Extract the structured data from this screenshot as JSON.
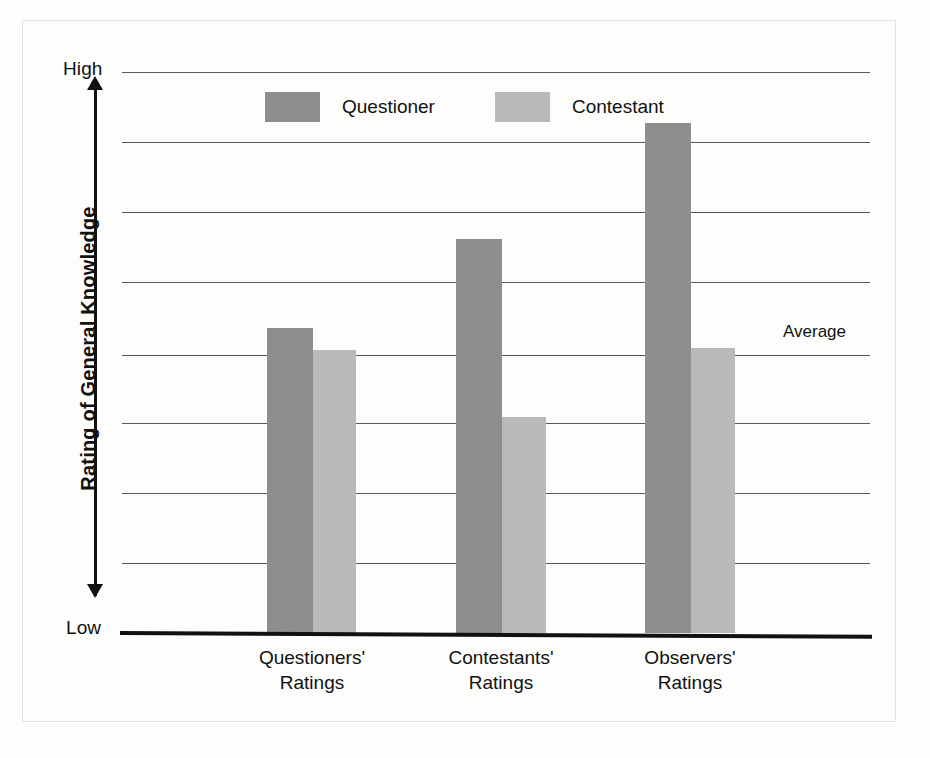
{
  "chart_data": {
    "type": "bar",
    "title": "",
    "subtitle": "",
    "xlabel": "",
    "ylabel": "Rating of General Knowledge",
    "categories": [
      "Questioners' Ratings",
      "Contestants' Ratings",
      "Observers' Ratings"
    ],
    "category_lines": [
      [
        "Questioners'",
        "Ratings"
      ],
      [
        "Contestants'",
        "Ratings"
      ],
      [
        "Observers'",
        "Ratings"
      ]
    ],
    "series": [
      {
        "name": "Questioner",
        "color": "#8e8e8e",
        "values": [
          0.544,
          0.702,
          0.909
        ]
      },
      {
        "name": "Contestant",
        "color": "#b9b9b9",
        "values": [
          0.504,
          0.385,
          0.508
        ]
      }
    ],
    "ylim": [
      0,
      1
    ],
    "y_axis_low_label": "Low",
    "y_axis_high_label": "High",
    "y_tick_labels": [
      "Low",
      "High"
    ],
    "gridlines": [
      0.0,
      0.125,
      0.25,
      0.375,
      0.495,
      0.625,
      0.75,
      0.875,
      1.0
    ],
    "grid": true,
    "annotations": [
      {
        "label": "Average",
        "value": 0.495,
        "position": "right"
      }
    ],
    "legend": {
      "position": "top-center",
      "entries": [
        {
          "label": "Questioner",
          "color": "#8e8e8e"
        },
        {
          "label": "Contestant",
          "color": "#b9b9b9"
        }
      ]
    }
  },
  "axis": {
    "high_label": "High",
    "low_label": "Low",
    "y_title": "Rating of General Knowledge"
  },
  "legend": {
    "questioner_label": "Questioner",
    "contestant_label": "Contestant"
  },
  "annotation": {
    "average_label": "Average"
  },
  "categories": [
    {
      "line1": "Questioners'",
      "line2": "Ratings"
    },
    {
      "line1": "Contestants'",
      "line2": "Ratings"
    },
    {
      "line1": "Observers'",
      "line2": "Ratings"
    }
  ],
  "colors": {
    "questioner": "#8e8e8e",
    "contestant": "#b9b9b9",
    "gridline": "#595959",
    "baseline": "#111111",
    "background": "#fdfdfb"
  }
}
